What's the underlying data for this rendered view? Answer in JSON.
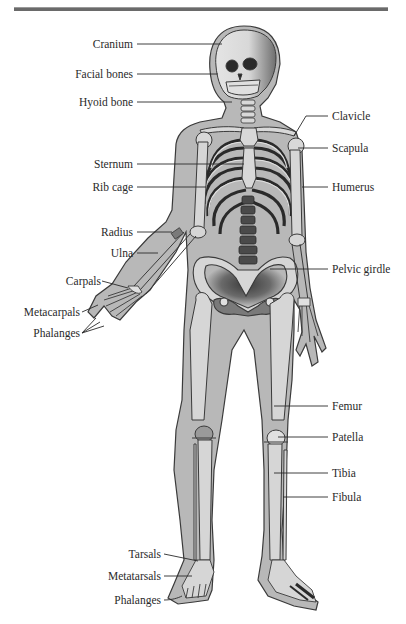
{
  "diagram": {
    "title": "",
    "colors": {
      "body_fill": "#b8b8b8",
      "bone_fill": "#d6d6d6",
      "outline": "#3a3a3a",
      "dark_shade": "#555555",
      "label_text": "#2a2a2a",
      "leader_line": "#2a2a2a",
      "rule": "#6a6a6a"
    },
    "labels_left": [
      {
        "id": "cranium",
        "text": "Cranium"
      },
      {
        "id": "facial-bones",
        "text": "Facial bones"
      },
      {
        "id": "hyoid-bone",
        "text": "Hyoid bone"
      },
      {
        "id": "sternum",
        "text": "Sternum"
      },
      {
        "id": "rib-cage",
        "text": "Rib cage"
      },
      {
        "id": "radius",
        "text": "Radius"
      },
      {
        "id": "ulna",
        "text": "Ulna"
      },
      {
        "id": "carpals",
        "text": "Carpals"
      },
      {
        "id": "metacarpals",
        "text": "Metacarpals"
      },
      {
        "id": "phalanges-hand",
        "text": "Phalanges"
      },
      {
        "id": "tarsals",
        "text": "Tarsals"
      },
      {
        "id": "metatarsals",
        "text": "Metatarsals"
      },
      {
        "id": "phalanges-foot",
        "text": "Phalanges"
      }
    ],
    "labels_right": [
      {
        "id": "clavicle",
        "text": "Clavicle"
      },
      {
        "id": "scapula",
        "text": "Scapula"
      },
      {
        "id": "humerus",
        "text": "Humerus"
      },
      {
        "id": "pelvic-girdle",
        "text": "Pelvic girdle"
      },
      {
        "id": "femur",
        "text": "Femur"
      },
      {
        "id": "patella",
        "text": "Patella"
      },
      {
        "id": "tibia",
        "text": "Tibia"
      },
      {
        "id": "fibula",
        "text": "Fibula"
      }
    ]
  }
}
